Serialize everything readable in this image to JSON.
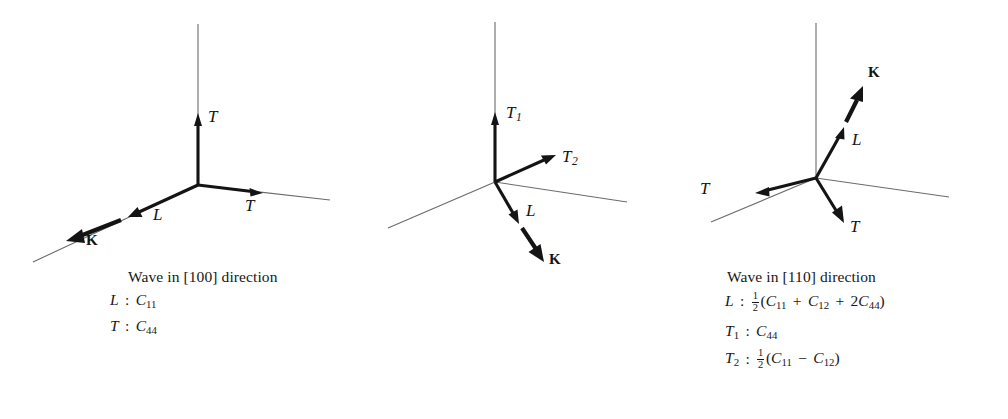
{
  "figure": {
    "background_color": "#ffffff",
    "ink_color": "#171717",
    "thin_axis_color": "#6b6b6b"
  },
  "panels": [
    {
      "id": "100",
      "caption": "Wave in [100] direction",
      "direction": "[100]",
      "vector_labels": [
        {
          "name": "T-up",
          "text": "T",
          "style": "italic"
        },
        {
          "name": "T-right",
          "text": "T",
          "style": "italic"
        },
        {
          "name": "L",
          "text": "L",
          "style": "italic"
        },
        {
          "name": "K",
          "text": "K",
          "style": "bold-upright"
        }
      ],
      "formulas": [
        {
          "mode": "L",
          "parts": [
            {
              "t": "L",
              "k": "it"
            },
            {
              "t": " : ",
              "k": "op"
            },
            {
              "t": "C",
              "k": "it"
            },
            {
              "t": "11",
              "k": "sub"
            }
          ]
        },
        {
          "mode": "T",
          "parts": [
            {
              "t": "T",
              "k": "it"
            },
            {
              "t": " : ",
              "k": "op"
            },
            {
              "t": "C",
              "k": "it"
            },
            {
              "t": "44",
              "k": "sub"
            }
          ]
        }
      ]
    },
    {
      "id": "110",
      "caption": "Wave in [110] direction",
      "direction": "[110]",
      "vector_labels": [
        {
          "name": "T1",
          "text": "T",
          "sub": "1",
          "style": "italic"
        },
        {
          "name": "T2",
          "text": "T",
          "sub": "2",
          "style": "italic"
        },
        {
          "name": "L",
          "text": "L",
          "style": "italic"
        },
        {
          "name": "K",
          "text": "K",
          "style": "bold-upright"
        }
      ],
      "formulas": [
        {
          "mode": "L",
          "parts": [
            {
              "t": "L",
              "k": "it"
            },
            {
              "t": " : ",
              "k": "op"
            },
            {
              "t": "1/2",
              "k": "frac",
              "num": "1",
              "den": "2"
            },
            {
              "t": "(",
              "k": "paren"
            },
            {
              "t": "C",
              "k": "it"
            },
            {
              "t": "11",
              "k": "sub"
            },
            {
              "t": " + ",
              "k": "op"
            },
            {
              "t": "C",
              "k": "it"
            },
            {
              "t": "12",
              "k": "sub"
            },
            {
              "t": " + ",
              "k": "op"
            },
            {
              "t": "2",
              "k": "paren"
            },
            {
              "t": "C",
              "k": "it"
            },
            {
              "t": "44",
              "k": "sub"
            },
            {
              "t": ")",
              "k": "paren"
            }
          ]
        },
        {
          "mode": "T1",
          "parts": [
            {
              "t": "T",
              "k": "it"
            },
            {
              "t": "1",
              "k": "sub"
            },
            {
              "t": " : ",
              "k": "op"
            },
            {
              "t": "C",
              "k": "it"
            },
            {
              "t": "44",
              "k": "sub"
            }
          ]
        },
        {
          "mode": "T2",
          "parts": [
            {
              "t": "T",
              "k": "it"
            },
            {
              "t": "2",
              "k": "sub"
            },
            {
              "t": " : ",
              "k": "op"
            },
            {
              "t": "1/2",
              "k": "frac",
              "num": "1",
              "den": "2"
            },
            {
              "t": "(",
              "k": "paren"
            },
            {
              "t": "C",
              "k": "it"
            },
            {
              "t": "11",
              "k": "sub"
            },
            {
              "t": " − ",
              "k": "op"
            },
            {
              "t": "C",
              "k": "it"
            },
            {
              "t": "12",
              "k": "sub"
            },
            {
              "t": ")",
              "k": "paren"
            }
          ]
        }
      ]
    },
    {
      "id": "111",
      "caption": "Wave in [111] direction",
      "direction": "[111]",
      "vector_labels": [
        {
          "name": "T-left",
          "text": "T",
          "style": "italic"
        },
        {
          "name": "T-lower",
          "text": "T",
          "style": "italic"
        },
        {
          "name": "L",
          "text": "L",
          "style": "italic"
        },
        {
          "name": "K",
          "text": "K",
          "style": "bold-upright"
        }
      ],
      "formulas": [
        {
          "mode": "L",
          "parts": [
            {
              "t": "L",
              "k": "it"
            },
            {
              "t": " : ",
              "k": "op"
            },
            {
              "t": "1/3",
              "k": "frac",
              "num": "1",
              "den": "3"
            },
            {
              "t": "(",
              "k": "paren"
            },
            {
              "t": "C",
              "k": "it"
            },
            {
              "t": "11",
              "k": "sub"
            },
            {
              "t": " + ",
              "k": "op"
            },
            {
              "t": "2",
              "k": "paren"
            },
            {
              "t": "C",
              "k": "it"
            },
            {
              "t": "12",
              "k": "sub"
            },
            {
              "t": " + ",
              "k": "op"
            },
            {
              "t": "4",
              "k": "paren"
            },
            {
              "t": "C",
              "k": "it"
            },
            {
              "t": "44",
              "k": "sub"
            },
            {
              "t": ")",
              "k": "paren"
            }
          ]
        },
        {
          "mode": "T",
          "parts": [
            {
              "t": "T",
              "k": "it"
            },
            {
              "t": " : ",
              "k": "op"
            },
            {
              "t": "1/3",
              "k": "frac",
              "num": "1",
              "den": "3"
            },
            {
              "t": "(",
              "k": "paren"
            },
            {
              "t": "C",
              "k": "it"
            },
            {
              "t": "11",
              "k": "sub"
            },
            {
              "t": " − ",
              "k": "op"
            },
            {
              "t": "C",
              "k": "it"
            },
            {
              "t": "12",
              "k": "sub"
            },
            {
              "t": " + ",
              "k": "op"
            },
            {
              "t": "C",
              "k": "it"
            },
            {
              "t": "44",
              "k": "sub"
            },
            {
              "t": ")",
              "k": "paren"
            }
          ]
        }
      ]
    }
  ],
  "labels_100": {
    "t_up": "T",
    "t_right": "T",
    "l": "L",
    "k": "K"
  },
  "labels_110": {
    "t1": "T",
    "t1_sub": "1",
    "t2": "T",
    "t2_sub": "2",
    "l": "L",
    "k": "K"
  },
  "labels_111": {
    "t_left": "T",
    "t_lower": "T",
    "l": "L",
    "k": "K"
  }
}
